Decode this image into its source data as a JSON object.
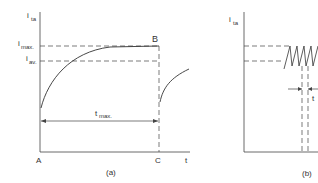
{
  "panel_a": {
    "y_axis_label": "i",
    "y_axis_sub": "ta",
    "i_max_label": "i",
    "i_max_sub": "max.",
    "i_av_label": "i",
    "i_av_sub": "av.",
    "point_b": "B",
    "point_a": "A",
    "point_c": "C",
    "x_axis_label": "t",
    "t_max_label": "t",
    "t_max_sub": "max.",
    "caption": "(a)"
  },
  "panel_b": {
    "y_axis_label": "i",
    "y_axis_sub": "ta",
    "interval_label": "t",
    "caption": "(b)"
  },
  "colors": {
    "line": "#333333",
    "background": "#ffffff"
  }
}
